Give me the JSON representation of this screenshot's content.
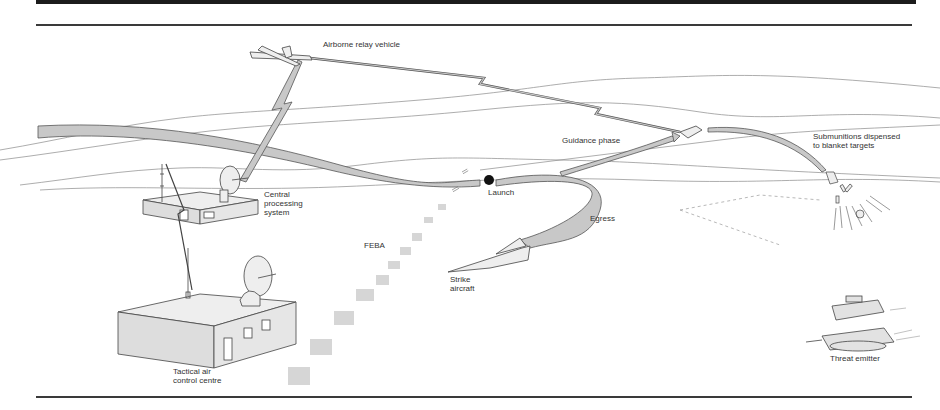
{
  "diagram": {
    "labels": {
      "airborne_relay": "Airborne relay vehicle",
      "central_processing": "Central\nprocessing\nsystem",
      "tactical_air": "Tactical air\ncontrol centre",
      "feba": "FEBA",
      "launch": "Launch",
      "egress": "Egress",
      "strike_aircraft": "Strike\naircraft",
      "guidance_phase": "Guidance phase",
      "submunitions": "Submunitions dispensed\nto blanket targets",
      "threat_emitter": "Threat emitter"
    },
    "colors": {
      "band_fill": "#c8c8c8",
      "band_stroke": "#555555",
      "line": "#444444",
      "terrain": "#888888",
      "building_fill": "#e6e6e6"
    }
  }
}
